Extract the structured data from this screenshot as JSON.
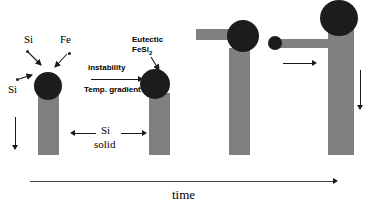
{
  "figure": {
    "caption_axis_label": "time",
    "labels": {
      "si_top": "Si",
      "fe_top": "Fe",
      "si_left": "Si",
      "instability": "instability",
      "temp_gradient": "Temp. gradient",
      "eutectic_line1": "Eutectic",
      "eutectic_line2_base": "FeSi",
      "eutectic_line2_sub": "2",
      "si_solid_line1": "Si",
      "si_solid_line2": "solid"
    },
    "colors": {
      "column_gray": "#808080",
      "droplet_dark": "#1c1c1c",
      "arrow_black": "#1a1a1a",
      "background": "#ffffff"
    },
    "stages": [
      {
        "id": "stage-1",
        "name": "nucleation-stage",
        "column": {
          "x": 38,
          "y": 93,
          "w": 21,
          "h": 62
        },
        "droplet": {
          "cx": 48,
          "cy": 86,
          "r": 14
        },
        "has_arm": false
      },
      {
        "id": "stage-2",
        "name": "instability-stage",
        "column": {
          "x": 149,
          "y": 93,
          "w": 21,
          "h": 62
        },
        "droplet": {
          "cx": 155,
          "cy": 84,
          "r": 15
        },
        "has_arm": false
      },
      {
        "id": "stage-3",
        "name": "lateral-growth-stage",
        "column": {
          "x": 229,
          "y": 48,
          "w": 21,
          "h": 107
        },
        "droplet": {
          "cx": 243,
          "cy": 36,
          "r": 16
        },
        "has_arm": true,
        "arm": {
          "x": 196,
          "y": 29,
          "w": 38,
          "h": 11
        },
        "arm_ball": null
      },
      {
        "id": "stage-4",
        "name": "elongated-arm-stage",
        "column": {
          "x": 328,
          "y": 26,
          "w": 26,
          "h": 129
        },
        "droplet": {
          "cx": 338,
          "cy": 18,
          "r": 19
        },
        "has_arm": true,
        "arm": {
          "x": 272,
          "y": 39,
          "w": 62,
          "h": 9
        },
        "arm_ball": {
          "cx": 275,
          "cy": 43,
          "r": 7
        }
      }
    ],
    "arrows": {
      "time_axis": {
        "x": 30,
        "y": 181,
        "length": 308,
        "direction": "right"
      },
      "instability": {
        "x": 91,
        "y": 79,
        "length": 50,
        "direction": "right"
      },
      "drop_left": {
        "x": 15,
        "y": 117,
        "length": 33,
        "direction": "down"
      },
      "drop_right": {
        "x": 360,
        "y": 70,
        "length": 40,
        "direction": "down"
      },
      "arm_motion": {
        "x": 283,
        "y": 63,
        "length": 32,
        "direction": "right"
      },
      "si_solid_left": {
        "x": 72,
        "y": 133,
        "length": 24,
        "direction": "left"
      },
      "si_solid_right": {
        "x": 122,
        "y": 133,
        "length": 24,
        "direction": "right"
      }
    },
    "feed_arrows": [
      {
        "name": "si-top-feed",
        "x1": 28,
        "y1": 52,
        "x2": 42,
        "y2": 66
      },
      {
        "name": "fe-top-feed",
        "x1": 66,
        "y1": 54,
        "x2": 54,
        "y2": 68
      },
      {
        "name": "si-left-feed",
        "x1": 19,
        "y1": 80,
        "x2": 33,
        "y2": 75
      },
      {
        "name": "eutectic-feed",
        "x1": 152,
        "y1": 56,
        "x2": 160,
        "y2": 70
      }
    ],
    "feed_dots": [
      {
        "name": "si-particle-a",
        "x": 26,
        "y": 50
      },
      {
        "name": "fe-particle-a",
        "x": 68,
        "y": 52
      },
      {
        "name": "si-particle-b",
        "x": 16,
        "y": 78
      }
    ]
  }
}
